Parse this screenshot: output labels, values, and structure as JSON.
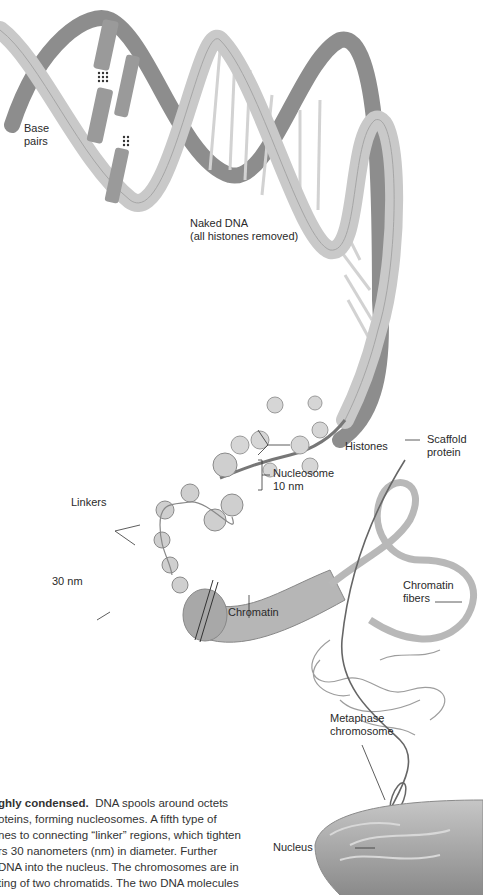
{
  "labels": {
    "base_pairs": [
      "Base",
      "pairs"
    ],
    "bases": [
      "C",
      "G",
      "A",
      "T"
    ],
    "naked_dna": [
      "Naked DNA",
      "(all histones removed)"
    ],
    "histones": "Histones",
    "scaffold_protein": [
      "Scaffold",
      "protein"
    ],
    "nucleosome": [
      "Nucleosome",
      "10 nm"
    ],
    "linkers": "Linkers",
    "thirty_nm": "30 nm",
    "chromatin": "Chromatin",
    "chromatin_fibers": [
      "Chromatin",
      "fibers"
    ],
    "metaphase_chromosome": [
      "Metaphase",
      "chromosome"
    ],
    "nucleus": "Nucleus"
  },
  "caption": {
    "bold": "ghly condensed.",
    "lines": [
      "DNA spools around octets",
      "oteins, forming nucleosomes. A fifth type of",
      "nes to connecting “linker” regions, which tighten",
      "rs 30 nanometers (nm) in diameter. Further",
      "DNA into the nucleus. The chromosomes are in",
      "ting of two chromatids. The two DNA molecules"
    ]
  },
  "colors": {
    "ribbon_light": "#c9c9c9",
    "ribbon_dark": "#8d8d8d",
    "outline": "#6e6e6e",
    "nucleus": "#a9a9a9"
  }
}
